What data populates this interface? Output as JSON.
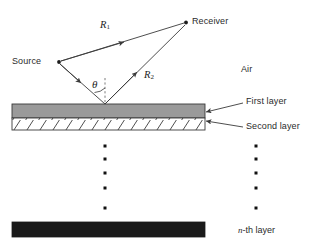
{
  "figure": {
    "type": "ray-diagram"
  },
  "labels": {
    "source": "Source",
    "receiver": "Receiver",
    "air": "Air",
    "first_layer": "First layer",
    "second_layer": "Second layer",
    "nth_layer_prefix": "n",
    "nth_layer_suffix": "-th layer"
  },
  "rays": {
    "direct": {
      "symbol": "R",
      "subscript": "1"
    },
    "reflected": {
      "symbol": "R",
      "subscript": "2"
    },
    "angle": {
      "symbol": "θ"
    }
  },
  "colors": {
    "first_layer_fill": "#9a9a9a",
    "second_layer_fill": "#ffffff",
    "nth_layer_fill": "#1a1a1a",
    "stroke": "#3a3a3a",
    "text": "#2b2b2b"
  },
  "geometry": {
    "source_point": [
      58,
      62
    ],
    "receiver_point": [
      186,
      22
    ],
    "reflection_point": [
      105,
      104
    ],
    "first_layer": {
      "x": 12,
      "y": 104,
      "width": 193,
      "height": 14
    },
    "second_layer": {
      "x": 12,
      "y": 118,
      "width": 193,
      "height": 12
    },
    "nth_layer": {
      "x": 12,
      "y": 222,
      "width": 193,
      "height": 15
    },
    "dot_column_left_x": 105,
    "dot_column_right_x": 256,
    "dot_rows_y": [
      146,
      159,
      173,
      188,
      208
    ]
  }
}
